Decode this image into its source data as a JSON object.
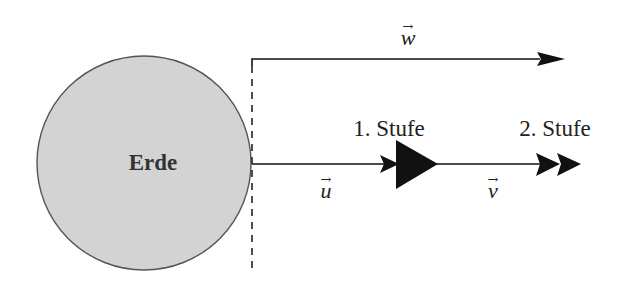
{
  "diagram": {
    "earth": {
      "label": "Erde",
      "fill": "#d3d3d3",
      "stroke": "#555555"
    },
    "vectors": {
      "w": {
        "label": "w",
        "arrow_symbol": "→"
      },
      "u": {
        "label": "u",
        "arrow_symbol": "→"
      },
      "v": {
        "label": "v",
        "arrow_symbol": "→"
      }
    },
    "stages": [
      {
        "label": "1. Stufe"
      },
      {
        "label": "2. Stufe"
      }
    ],
    "colors": {
      "line": "#111111",
      "background": "#ffffff"
    }
  }
}
